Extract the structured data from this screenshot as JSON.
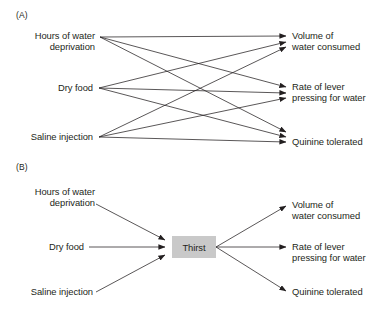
{
  "figure": {
    "type": "diagram",
    "subtype": "bipartite-flow-diagram",
    "background_color": "#ffffff",
    "line_color": "#231f20",
    "text_color": "#231f20",
    "hub_fill_color": "#c9c9c9"
  },
  "panels": [
    {
      "id": "A",
      "label": "(A)",
      "description": "Fully connected mapping: each of three antecedent conditions links directly to each of three behavioural measures.",
      "inputs": [
        {
          "id": "hours-water-deprivation",
          "line1": "Hours of water",
          "line2": "deprivation"
        },
        {
          "id": "dry-food",
          "line1": "Dry food",
          "line2": ""
        },
        {
          "id": "saline-injection",
          "line1": "Saline injection",
          "line2": ""
        }
      ],
      "outputs": [
        {
          "id": "volume-water-consumed",
          "line1": "Volume of",
          "line2": "water consumed"
        },
        {
          "id": "rate-lever-pressing",
          "line1": "Rate of lever",
          "line2": "pressing for water"
        },
        {
          "id": "quinine-tolerated",
          "line1": "Quinine tolerated",
          "line2": ""
        }
      ],
      "edge_count": 9
    },
    {
      "id": "B",
      "label": "(B)",
      "description": "Intervening variable model: three antecedent conditions converge on a single construct which then maps to three behavioural measures.",
      "inputs": [
        {
          "id": "hours-water-deprivation",
          "line1": "Hours of water",
          "line2": "deprivation"
        },
        {
          "id": "dry-food",
          "line1": "Dry food",
          "line2": ""
        },
        {
          "id": "saline-injection",
          "line1": "Saline injection",
          "line2": ""
        }
      ],
      "hub": {
        "id": "thirst",
        "label": "Thirst"
      },
      "outputs": [
        {
          "id": "volume-water-consumed",
          "line1": "Volume of",
          "line2": "water consumed"
        },
        {
          "id": "rate-lever-pressing",
          "line1": "Rate of lever",
          "line2": "pressing for water"
        },
        {
          "id": "quinine-tolerated",
          "line1": "Quinine tolerated",
          "line2": ""
        }
      ],
      "edge_count": 6
    }
  ]
}
